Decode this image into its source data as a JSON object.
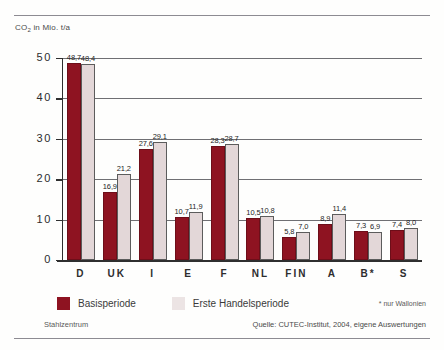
{
  "header": {
    "axis_title": "CO",
    "axis_title_sub": "2",
    "axis_title_rest": " in Mio. t/a"
  },
  "legend": {
    "items": [
      {
        "label": "Basisperiode",
        "color": "#8e1321"
      },
      {
        "label": "Erste Handelsperiode",
        "color": "#ece4e4"
      }
    ]
  },
  "footnote": "* nur Wallonien",
  "source_left": "Stahlzentrum",
  "source_right": "Quelle: CUTEC-Institut, 2004, eigene Auswertungen",
  "chart_data": {
    "type": "bar",
    "title": "CO2 in Mio. t/a",
    "xlabel": "",
    "ylabel": "CO2 in Mio. t/a",
    "ylim": [
      0,
      50
    ],
    "yticks": [
      "0",
      "10",
      "20",
      "30",
      "40",
      "50"
    ],
    "grid": true,
    "legend_position": "bottom-left",
    "categories": [
      "D",
      "UK",
      "I",
      "E",
      "F",
      "NL",
      "FIN",
      "A",
      "B*",
      "S"
    ],
    "series": [
      {
        "name": "Basisperiode",
        "color": "#8e1321",
        "values": [
          48.7,
          16.9,
          27.6,
          10.7,
          28.3,
          10.5,
          5.8,
          8.9,
          7.3,
          7.4
        ],
        "labels": [
          "48,7",
          "16,9",
          "27,6",
          "10,7",
          "28,3",
          "10,5",
          "5,8",
          "8,9",
          "7,3",
          "7,4"
        ]
      },
      {
        "name": "Erste Handelsperiode",
        "color": "#e3d7d8",
        "values": [
          48.4,
          21.2,
          29.1,
          11.9,
          28.7,
          10.8,
          7.0,
          11.4,
          6.9,
          8.0
        ],
        "labels": [
          "48,4",
          "21,2",
          "29,1",
          "11,9",
          "28,7",
          "10,8",
          "7,0",
          "11,4",
          "6,9",
          "8,0"
        ]
      }
    ]
  }
}
